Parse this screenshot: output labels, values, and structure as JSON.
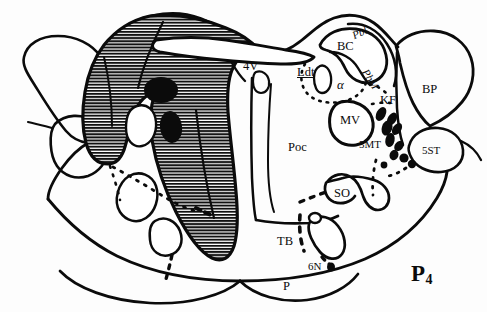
{
  "figure": {
    "plate_label": "P",
    "plate_subscript": "4"
  },
  "colors": {
    "ink": "#0b0b0b",
    "background": "#fdfdfd",
    "hatch": "#111111"
  },
  "labels": [
    {
      "id": "4v",
      "text": "4V",
      "x": 243,
      "y": 60,
      "style": "plain"
    },
    {
      "id": "ldt",
      "text": "Ldt",
      "x": 297,
      "y": 68,
      "style": "underline"
    },
    {
      "id": "bc",
      "text": "BC",
      "x": 337,
      "y": 41,
      "style": "plain"
    },
    {
      "id": "pbl",
      "text": "Pbl",
      "x": 357,
      "y": 33,
      "style": "rot-pbl"
    },
    {
      "id": "pbm",
      "text": "PbM",
      "x": 363,
      "y": 66,
      "style": "rot-pbm"
    },
    {
      "id": "alpha",
      "text": "α",
      "x": 339,
      "y": 83,
      "style": "alpha"
    },
    {
      "id": "kf",
      "text": "KF",
      "x": 381,
      "y": 96,
      "style": "plain"
    },
    {
      "id": "bp",
      "text": "BP",
      "x": 424,
      "y": 86,
      "style": "plain"
    },
    {
      "id": "mv",
      "text": "MV",
      "x": 350,
      "y": 118,
      "style": "plain"
    },
    {
      "id": "smt",
      "text": "5MT",
      "x": 363,
      "y": 142,
      "style": "plain"
    },
    {
      "id": "5st",
      "text": "5ST",
      "x": 424,
      "y": 148,
      "style": "plain"
    },
    {
      "id": "poc",
      "text": "Poc",
      "x": 290,
      "y": 144,
      "style": "plain"
    },
    {
      "id": "so",
      "text": "SO",
      "x": 338,
      "y": 191,
      "style": "plain"
    },
    {
      "id": "tb",
      "text": "TB",
      "x": 279,
      "y": 238,
      "style": "plain"
    },
    {
      "id": "6n",
      "text": "6N",
      "x": 311,
      "y": 264,
      "style": "plain"
    },
    {
      "id": "p",
      "text": "P",
      "x": 284,
      "y": 283,
      "style": "plain"
    }
  ],
  "structures": [
    {
      "id": "fourth-ventricle",
      "abbrev": "4V",
      "name": "Fourth ventricle"
    },
    {
      "id": "laterodorsal-tegmental",
      "abbrev": "Ldt",
      "name": "Laterodorsal tegmental nucleus"
    },
    {
      "id": "brachium-conjunctivum",
      "abbrev": "BC",
      "name": "Brachium conjunctivum"
    },
    {
      "id": "parabrachial-lateral",
      "abbrev": "Pbl",
      "name": "Lateral parabrachial nucleus"
    },
    {
      "id": "parabrachial-medial",
      "abbrev": "PbM",
      "name": "Medial parabrachial nucleus"
    },
    {
      "id": "alpha-subnucleus",
      "abbrev": "α",
      "name": "Alpha subnucleus"
    },
    {
      "id": "kolliker-fuse",
      "abbrev": "KF",
      "name": "Kolliker-Fuse nucleus"
    },
    {
      "id": "brachium-pontis",
      "abbrev": "BP",
      "name": "Brachium pontis"
    },
    {
      "id": "motor-trigeminal",
      "abbrev": "MV",
      "name": "Motor trigeminal nucleus"
    },
    {
      "id": "mesencephalic-tract-5",
      "abbrev": "5MT",
      "name": "Trigeminal motor tract"
    },
    {
      "id": "spinal-trigeminal-tract",
      "abbrev": "5ST",
      "name": "Spinal trigeminal tract"
    },
    {
      "id": "pontine-reticular-oral",
      "abbrev": "Poc",
      "name": "Pontine reticular nucleus, oral"
    },
    {
      "id": "superior-olive",
      "abbrev": "SO",
      "name": "Superior olive"
    },
    {
      "id": "trapezoid-body",
      "abbrev": "TB",
      "name": "Trapezoid body"
    },
    {
      "id": "abducens-nerve",
      "abbrev": "6N",
      "name": "Abducens nerve"
    },
    {
      "id": "pyramidal-tract",
      "abbrev": "P",
      "name": "Pyramidal tract"
    }
  ]
}
